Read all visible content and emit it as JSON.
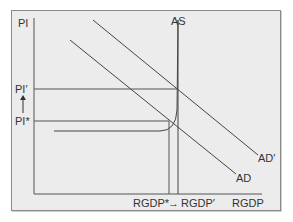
{
  "diagram": {
    "type": "AS-AD economic diagram",
    "y_axis_label": "PI",
    "x_axis_label": "RGDP",
    "curves": {
      "as_label": "AS",
      "ad_label": "AD",
      "ad_shifted_label": "AD′"
    },
    "price_levels": {
      "initial": "PI*",
      "new": "PI′",
      "arrow": "up"
    },
    "output_levels": {
      "initial": "RGDP*",
      "arrow": "→",
      "new": "RGDP′"
    },
    "colors": {
      "background": "#ececec",
      "lines": "#555555",
      "text": "#333333"
    }
  }
}
